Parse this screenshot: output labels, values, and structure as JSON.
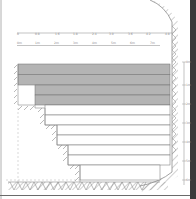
{
  "diagram": {
    "type": "stepped-section-drawing",
    "colors": {
      "background": "#ffffff",
      "shaded_band": "#b4b4b4",
      "line": "#6e6e6e",
      "hatch": "#8c8c8c",
      "frame": "#3a3a3a"
    },
    "top_ruler_1": {
      "labels": [
        "0",
        "0.8",
        "1.6",
        "1.8",
        "2.4",
        "3.0",
        "3.6",
        "4.2",
        "4.8"
      ]
    },
    "top_ruler_2": {
      "labels": [
        "0m",
        "1m",
        "2m",
        "3m",
        "4m",
        "5m",
        "6m",
        "7m"
      ]
    },
    "right_scale": {
      "labels": [
        "0m",
        "1m",
        "2m",
        "3m",
        "4m",
        "5m",
        "6m"
      ]
    },
    "bands": [
      {
        "name": "layer-1",
        "shaded": true
      },
      {
        "name": "layer-2",
        "shaded": true
      },
      {
        "name": "layer-3",
        "shaded": true
      },
      {
        "name": "layer-4",
        "shaded": true
      },
      {
        "name": "layer-5",
        "shaded": false
      },
      {
        "name": "layer-6",
        "shaded": false
      },
      {
        "name": "layer-7",
        "shaded": false
      },
      {
        "name": "layer-8",
        "shaded": false
      },
      {
        "name": "layer-9",
        "shaded": false
      },
      {
        "name": "layer-10",
        "shaded": false
      },
      {
        "name": "layer-11",
        "shaded": false
      }
    ]
  }
}
